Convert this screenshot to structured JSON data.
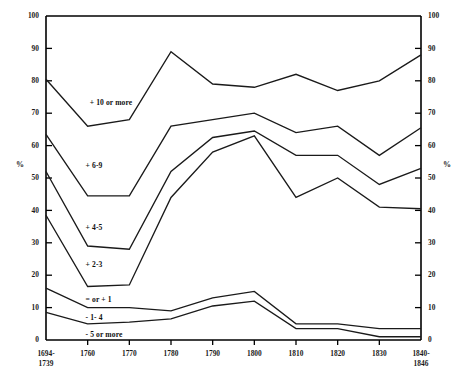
{
  "chart_data": {
    "type": "line",
    "title": "",
    "subtitle": "",
    "xlabel": "",
    "ylabel": "%",
    "ylabel_right": "%",
    "ylim": [
      0,
      100
    ],
    "ytick_values": [
      0,
      10,
      20,
      30,
      40,
      50,
      60,
      70,
      80,
      90,
      100
    ],
    "ytick_labels": [
      "0",
      "10",
      "20",
      "30",
      "40",
      "50",
      "60",
      "70",
      "80",
      "90",
      "100"
    ],
    "grid": false,
    "legend_position": "inline-band-labels",
    "categories": [
      "1694-\n1739",
      "1760",
      "1770",
      "1780",
      "1790",
      "1800",
      "1810",
      "1820",
      "1830",
      "1840-\n1846"
    ],
    "xtick_labels": [
      {
        "line1": "1694-",
        "line2": "1739"
      },
      {
        "line1": "1760",
        "line2": ""
      },
      {
        "line1": "1770",
        "line2": ""
      },
      {
        "line1": "1780",
        "line2": ""
      },
      {
        "line1": "1790",
        "line2": ""
      },
      {
        "line1": "1800",
        "line2": ""
      },
      {
        "line1": "1810",
        "line2": ""
      },
      {
        "line1": "1820",
        "line2": ""
      },
      {
        "line1": "1830",
        "line2": ""
      },
      {
        "line1": "1840-",
        "line2": "1846"
      }
    ],
    "series": [
      {
        "name": "+ 10 or more",
        "label_x_index": 1.05,
        "label_y": 73.0,
        "values": [
          80.5,
          66.0,
          68.0,
          89.0,
          79.0,
          78.0,
          82.0,
          77.0,
          80.0,
          88.0
        ]
      },
      {
        "name": "+ 6-9",
        "label_x_index": 0.95,
        "label_y": 53.5,
        "values": [
          63.5,
          44.5,
          44.5,
          66.0,
          68.0,
          70.0,
          64.0,
          66.0,
          57.0,
          65.5
        ]
      },
      {
        "name": "+ 4-5",
        "label_x_index": 0.95,
        "label_y": 34.5,
        "values": [
          52.0,
          29.0,
          28.0,
          52.0,
          62.5,
          64.5,
          57.0,
          57.0,
          48.0,
          53.0
        ]
      },
      {
        "name": "+ 2-3",
        "label_x_index": 0.95,
        "label_y": 23.0,
        "values": [
          38.5,
          16.5,
          17.0,
          44.0,
          58.0,
          63.0,
          44.0,
          50.0,
          41.0,
          40.5
        ]
      },
      {
        "name": "= or + 1",
        "label_x_index": 0.95,
        "label_y": 12.4,
        "values": [
          16.0,
          10.0,
          10.0,
          9.0,
          13.0,
          15.0,
          5.0,
          5.0,
          3.5,
          3.5
        ]
      },
      {
        "name": "- 1- 4",
        "label_x_index": 0.95,
        "label_y": 6.8,
        "values": [
          8.5,
          5.0,
          5.5,
          6.5,
          10.5,
          12.0,
          3.5,
          3.5,
          1.0,
          1.0
        ]
      },
      {
        "name": "- 5 or more",
        "label_x_index": 0.95,
        "label_y": 1.6,
        "values": null
      }
    ],
    "colors": {
      "line": "#1a1a1a",
      "axis": "#000000",
      "background": "#ffffff",
      "text": "#1a1a1a"
    }
  },
  "plot_geometry": {
    "left": 46,
    "right": 421,
    "top": 16,
    "bottom": 340
  }
}
